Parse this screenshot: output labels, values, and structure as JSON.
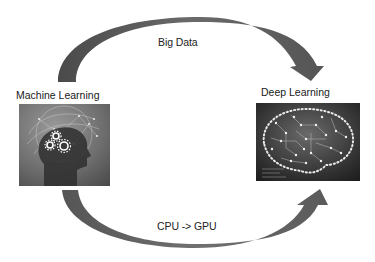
{
  "diagram": {
    "nodes": [
      {
        "id": "ml",
        "title": "Machine Learning",
        "image": "head-with-gears-icon"
      },
      {
        "id": "dl",
        "title": "Deep Learning",
        "image": "circuit-brain-icon"
      }
    ],
    "edges": [
      {
        "from": "ml",
        "to": "dl",
        "label": "Big Data",
        "path": "top-arc"
      },
      {
        "from": "ml",
        "to": "dl",
        "label": "CPU -> GPU",
        "path": "bottom-arc"
      }
    ],
    "colors": {
      "arrow": "#555555",
      "arrow_light": "#7a7a7a",
      "background": "#ffffff"
    }
  }
}
